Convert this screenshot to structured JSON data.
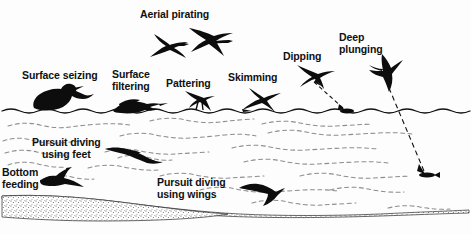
{
  "figure": {
    "background_color": "#fdfdfd",
    "ink_color": "#0d0d0d"
  },
  "labels": {
    "aerial_pirating": "Aerial pirating",
    "surface_seizing": "Surface seizing",
    "surface_filtering": "Surface\nfiltering",
    "pattering": "Pattering",
    "skimming": "Skimming",
    "dipping": "Dipping",
    "deep_plunging": "Deep\nplunging",
    "pursuit_diving_feet": "Pursuit diving\nusing feet",
    "bottom_feeding": "Bottom\nfeeding",
    "pursuit_diving_wings": "Pursuit diving\nusing wings"
  },
  "elements": {
    "water_surface": "wavy-waterline",
    "seabed": "stippled-sediment-wedge",
    "dipping_track": "dashed-trajectory-line",
    "plunging_track": "dashed-trajectory-line",
    "prey_surface": "fish-silhouette",
    "prey_deep": "fish-silhouette"
  },
  "birds": [
    {
      "name": "aerial-pirating-chaser",
      "method": "Aerial pirating"
    },
    {
      "name": "aerial-pirating-target",
      "method": "Aerial pirating"
    },
    {
      "name": "surface-seizing-bird",
      "method": "Surface seizing"
    },
    {
      "name": "surface-filtering-bird",
      "method": "Surface filtering"
    },
    {
      "name": "pattering-bird",
      "method": "Pattering"
    },
    {
      "name": "skimming-bird",
      "method": "Skimming"
    },
    {
      "name": "dipping-bird",
      "method": "Dipping"
    },
    {
      "name": "deep-plunging-bird",
      "method": "Deep plunging"
    },
    {
      "name": "pursuit-diving-feet-bird",
      "method": "Pursuit diving using feet"
    },
    {
      "name": "bottom-feeding-bird",
      "method": "Bottom feeding"
    },
    {
      "name": "pursuit-diving-wings-bird",
      "method": "Pursuit diving using wings"
    }
  ]
}
